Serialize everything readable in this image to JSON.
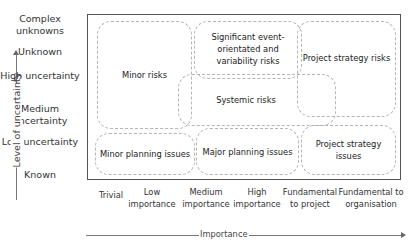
{
  "y_axis": {
    "title": "Level of uncertainty",
    "levels": [
      "Complex unknowns",
      "Unknown",
      "High uncertainty",
      "Medium uncertainty",
      "Low uncertainty",
      "Known"
    ]
  },
  "x_axis": {
    "title": "Importance",
    "levels": [
      "Trivial",
      "Low importance",
      "Medium importance",
      "High importance",
      "Fundamental to project",
      "Fundamental to organisation"
    ]
  },
  "zones": {
    "minor_risks": "Minor risks",
    "significant_risks": "Significant event-orientated and variability risks",
    "systemic_risks": "Systemic risks",
    "project_strategy_risks": "Project strategy risks",
    "minor_planning_issues": "Minor planning issues",
    "major_planning_issues": "Major planning issues",
    "project_strategy_issues": "Project strategy issues"
  }
}
